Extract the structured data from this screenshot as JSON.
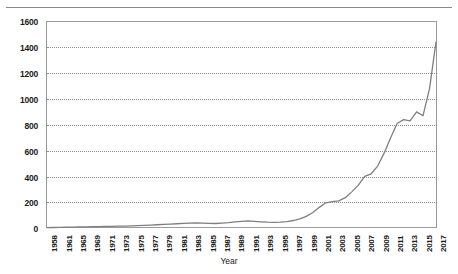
{
  "chart_data": {
    "type": "line",
    "title": "",
    "xlabel": "Year",
    "ylabel": "",
    "ylim": [
      0,
      1600
    ],
    "ytick_values": [
      0,
      200,
      400,
      600,
      800,
      1000,
      1200,
      1400,
      1600
    ],
    "ytick_labels": [
      "0",
      "200",
      "400",
      "600",
      "800",
      "1000",
      "1200",
      "1400",
      "1600"
    ],
    "xtick_labels": [
      "1958",
      "1961",
      "1965",
      "1969",
      "1971",
      "1973",
      "1975",
      "1977",
      "1979",
      "1981",
      "1983",
      "1985",
      "1987",
      "1989",
      "1991",
      "1993",
      "1995",
      "1997",
      "1999",
      "2001",
      "2003",
      "2005",
      "2007",
      "2009",
      "2011",
      "2013",
      "2015",
      "2017"
    ],
    "grid": true,
    "legend": false,
    "line_color": "#7f7f7f",
    "x": [
      1958,
      1959,
      1960,
      1961,
      1962,
      1963,
      1964,
      1965,
      1966,
      1967,
      1968,
      1969,
      1970,
      1971,
      1972,
      1973,
      1974,
      1975,
      1976,
      1977,
      1978,
      1979,
      1980,
      1981,
      1982,
      1983,
      1984,
      1985,
      1986,
      1987,
      1988,
      1989,
      1990,
      1991,
      1992,
      1993,
      1994,
      1995,
      1996,
      1997,
      1998,
      1999,
      2000,
      2001,
      2002,
      2003,
      2004,
      2005,
      2006,
      2007,
      2008,
      2009,
      2010,
      2011,
      2012,
      2013,
      2014,
      2015,
      2016,
      2017,
      2018
    ],
    "values": [
      3,
      4,
      5,
      6,
      7,
      8,
      9,
      10,
      11,
      12,
      13,
      14,
      15,
      16,
      18,
      20,
      22,
      25,
      28,
      30,
      33,
      36,
      38,
      40,
      38,
      36,
      35,
      38,
      42,
      48,
      52,
      55,
      52,
      48,
      45,
      44,
      46,
      50,
      58,
      70,
      90,
      120,
      160,
      195,
      205,
      210,
      235,
      280,
      330,
      400,
      420,
      480,
      580,
      700,
      810,
      840,
      830,
      900,
      870,
      1080,
      1440
    ],
    "series": [
      {
        "name": "value",
        "values": [
          3,
          4,
          5,
          6,
          7,
          8,
          9,
          10,
          11,
          12,
          13,
          14,
          15,
          16,
          18,
          20,
          22,
          25,
          28,
          30,
          33,
          36,
          38,
          40,
          38,
          36,
          35,
          38,
          42,
          48,
          52,
          55,
          52,
          48,
          45,
          44,
          46,
          50,
          58,
          70,
          90,
          120,
          160,
          195,
          205,
          210,
          235,
          280,
          330,
          400,
          420,
          480,
          580,
          700,
          810,
          840,
          830,
          900,
          870,
          1080,
          1440
        ]
      }
    ]
  },
  "axis": {
    "x_title": "Year"
  }
}
